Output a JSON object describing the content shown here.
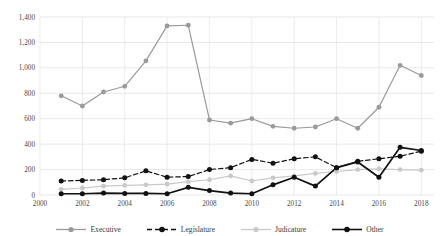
{
  "chart_data": {
    "type": "line",
    "title": "",
    "xlabel": "",
    "ylabel": "",
    "ylim": [
      0,
      1400
    ],
    "ytick_values": [
      0,
      200,
      400,
      600,
      800,
      1000,
      1200,
      1400
    ],
    "ytick_labels": [
      "0",
      "200",
      "400",
      "600",
      "800",
      "1,000",
      "1,200",
      "1,400"
    ],
    "grid": true,
    "legend_position": "bottom",
    "x": [
      2001,
      2002,
      2003,
      2004,
      2005,
      2006,
      2007,
      2008,
      2009,
      2010,
      2011,
      2012,
      2013,
      2014,
      2015,
      2016,
      2017,
      2018
    ],
    "xtick_values": [
      2000,
      2002,
      2004,
      2006,
      2008,
      2010,
      2012,
      2014,
      2016,
      2018
    ],
    "xtick_labels": [
      "2000",
      "2002",
      "2004",
      "2006",
      "2008",
      "2010",
      "2012",
      "2014",
      "2016",
      "2018"
    ],
    "xlim": [
      2000,
      2018.6
    ],
    "series": [
      {
        "name": "Executive",
        "color": "#9a9a9a",
        "dash": "none",
        "values": [
          780,
          700,
          810,
          855,
          1055,
          1330,
          1335,
          590,
          565,
          600,
          540,
          525,
          535,
          600,
          525,
          690,
          1020,
          940
        ]
      },
      {
        "name": "Legislature",
        "color": "#111111",
        "dash": "dashed",
        "values": [
          110,
          115,
          120,
          135,
          190,
          140,
          145,
          200,
          215,
          280,
          250,
          285,
          300,
          215,
          265,
          285,
          305,
          345
        ]
      },
      {
        "name": "Judicature",
        "color": "#c9c9c9",
        "dash": "none",
        "values": [
          45,
          55,
          70,
          75,
          80,
          85,
          105,
          120,
          150,
          110,
          135,
          150,
          170,
          185,
          200,
          205,
          200,
          195
        ]
      },
      {
        "name": "Other",
        "color": "#111111",
        "dash": "none",
        "values": [
          10,
          10,
          15,
          12,
          12,
          10,
          60,
          35,
          15,
          10,
          80,
          140,
          70,
          215,
          260,
          140,
          375,
          350
        ]
      }
    ]
  },
  "legend": {
    "items": [
      {
        "label": "Executive"
      },
      {
        "label": "Legislature"
      },
      {
        "label": "Judicature"
      },
      {
        "label": "Other"
      }
    ]
  }
}
